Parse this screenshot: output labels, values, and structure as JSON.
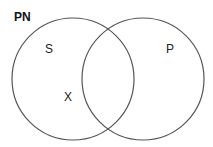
{
  "diagram": {
    "type": "venn",
    "title": "PN",
    "sets": [
      {
        "id": "left",
        "label": "S",
        "cx": 73,
        "cy": 79,
        "r": 61
      },
      {
        "id": "right",
        "label": "P",
        "cx": 143,
        "cy": 79,
        "r": 61
      }
    ],
    "marks": [
      {
        "label": "X",
        "region": "S only"
      }
    ],
    "colors": {
      "stroke": "#555555",
      "text": "#222222",
      "background": "#ffffff"
    }
  }
}
